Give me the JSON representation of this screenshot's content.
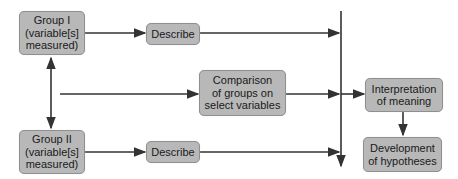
{
  "diagram": {
    "nodes": {
      "group1": "Group I\n(variable[s]\nmeasured)",
      "describe1": "Describe",
      "comparison": "Comparison\nof groups on\nselect variables",
      "group2": "Group II\n(variable[s]\nmeasured)",
      "describe2": "Describe",
      "interpretation": "Interpretation\nof meaning",
      "development": "Development\nof hypotheses"
    },
    "colors": {
      "box_fill": "#b8b8b8",
      "box_border": "#8f8f8f",
      "line": "#333333"
    }
  }
}
